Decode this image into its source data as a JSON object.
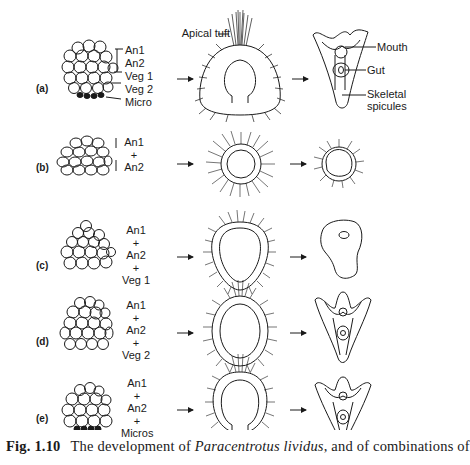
{
  "figure": {
    "rows": [
      {
        "letter": "(a)",
        "tiers": [
          "An1",
          "An2",
          "Veg 1",
          "Veg 2",
          "Micro"
        ]
      },
      {
        "letter": "(b)",
        "stack": [
          "An1",
          "+",
          "An2"
        ]
      },
      {
        "letter": "(c)",
        "stack": [
          "An1",
          "+",
          "An2",
          "+",
          "Veg 1"
        ]
      },
      {
        "letter": "(d)",
        "stack": [
          "An1",
          "+",
          "An2",
          "+",
          "Veg 2"
        ]
      },
      {
        "letter": "(e)",
        "stack": [
          "An1",
          "+",
          "An2",
          "+",
          "Micros"
        ]
      }
    ],
    "annotations": {
      "apical_tuft": "Apical tuft",
      "mouth": "Mouth",
      "gut": "Gut",
      "skeletal_1": "Skeletal",
      "skeletal_2": "spicules"
    }
  },
  "caption": {
    "label": "Fig. 1.10",
    "text_1": "The development of ",
    "species": "Paracentrotus lividus",
    "text_2": ", and of combinations of"
  }
}
